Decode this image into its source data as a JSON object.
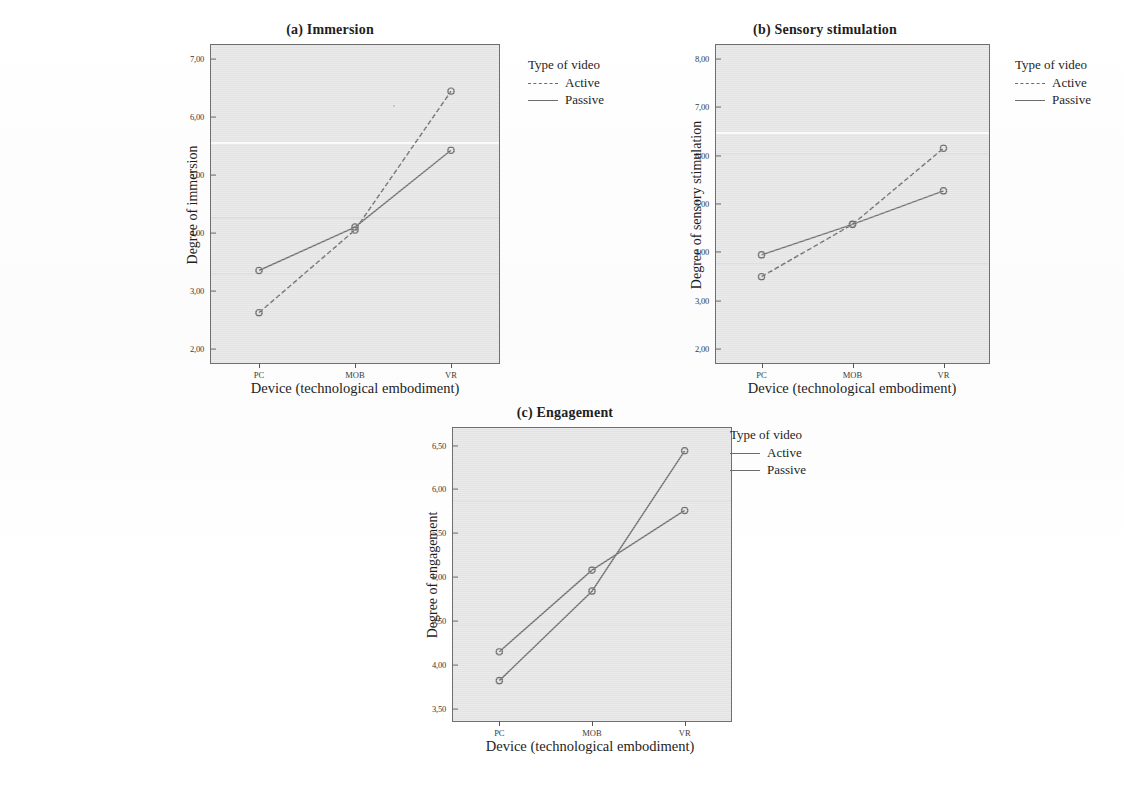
{
  "figure": {
    "panels": [
      "a",
      "b",
      "c"
    ],
    "shared_xlabel": "Device (technological embodiment)",
    "shared_legend_title": "Type of video",
    "series_names": [
      "Active",
      "Passive"
    ],
    "categories": [
      "PC",
      "MOB",
      "VR"
    ]
  },
  "panel_a": {
    "title": "(a) Immersion",
    "ylabel": "Degree of immersion",
    "xlabel": "Device (technological embodiment)",
    "yticks": [
      "7,00",
      "6,00",
      "5,00",
      "4,00",
      "3,00",
      "2,00"
    ],
    "xticks": [
      "PC",
      "MOB",
      "VR"
    ],
    "legend_title": "Type of video",
    "legend": [
      "Active",
      "Passive"
    ]
  },
  "panel_b": {
    "title": "(b) Sensory stimulation",
    "ylabel": "Degree of sensory stimulation",
    "xlabel": "Device (technological embodiment)",
    "yticks": [
      "8,00",
      "7,00",
      "6,00",
      "5,00",
      "4,00",
      "3,00",
      "2,00"
    ],
    "xticks": [
      "PC",
      "MOB",
      "VR"
    ],
    "legend_title": "Type of video",
    "legend": [
      "Active",
      "Passive"
    ]
  },
  "panel_c": {
    "title": "(c) Engagement",
    "ylabel": "Degree of engagement",
    "xlabel": "Device (technological embodiment)",
    "yticks": [
      "6,50",
      "6,00",
      "5,50",
      "5,00",
      "4,50",
      "4,00",
      "3,50"
    ],
    "xticks": [
      "PC",
      "MOB",
      "VR"
    ],
    "legend_title": "Type of video",
    "legend": [
      "Active",
      "Passive"
    ]
  },
  "chart_data": [
    {
      "id": "panel_a",
      "type": "line",
      "title": "(a) Immersion",
      "xlabel": "Device (technological embodiment)",
      "ylabel": "Degree of immersion",
      "categories": [
        "PC",
        "MOB",
        "VR"
      ],
      "ylim": [
        1.75,
        7.25
      ],
      "yticks": [
        2.0,
        3.0,
        4.0,
        5.0,
        6.0,
        7.0
      ],
      "ytick_labels": [
        "2,00",
        "3,00",
        "4,00",
        "5,00",
        "6,00",
        "7,00"
      ],
      "grid": false,
      "legend_title": "Type of video",
      "legend_position": "right",
      "series": [
        {
          "name": "Active",
          "style": "dashed",
          "color": "#707070",
          "values": [
            2.62,
            4.05,
            6.45
          ]
        },
        {
          "name": "Passive",
          "style": "solid",
          "color": "#707070",
          "values": [
            3.35,
            4.1,
            5.43
          ]
        }
      ]
    },
    {
      "id": "panel_b",
      "type": "line",
      "title": "(b) Sensory stimulation",
      "xlabel": "Device (technological embodiment)",
      "ylabel": "Degree of sensory stimulation",
      "categories": [
        "PC",
        "MOB",
        "VR"
      ],
      "ylim": [
        1.72,
        8.28
      ],
      "yticks": [
        2.0,
        3.0,
        4.0,
        5.0,
        6.0,
        7.0,
        8.0
      ],
      "ytick_labels": [
        "2,00",
        "3,00",
        "4,00",
        "5,00",
        "6,00",
        "7,00",
        "8,00"
      ],
      "grid": false,
      "legend_title": "Type of video",
      "legend_position": "right",
      "series": [
        {
          "name": "Active",
          "style": "dashed",
          "color": "#707070",
          "values": [
            3.5,
            4.58,
            6.15
          ]
        },
        {
          "name": "Passive",
          "style": "solid",
          "color": "#707070",
          "values": [
            3.95,
            4.58,
            5.27
          ]
        }
      ]
    },
    {
      "id": "panel_c",
      "type": "line",
      "title": "(c) Engagement",
      "xlabel": "Device (technological embodiment)",
      "ylabel": "Degree of engagement",
      "categories": [
        "PC",
        "MOB",
        "VR"
      ],
      "ylim": [
        3.36,
        6.7
      ],
      "yticks": [
        3.5,
        4.0,
        4.5,
        5.0,
        5.5,
        6.0,
        6.5
      ],
      "ytick_labels": [
        "3,50",
        "4,00",
        "4,50",
        "5,00",
        "5,50",
        "6,00",
        "6,50"
      ],
      "grid": false,
      "legend_title": "Type of video",
      "legend_position": "right",
      "series": [
        {
          "name": "Active",
          "style": "solid",
          "color": "#707070",
          "values": [
            3.82,
            4.84,
            6.44
          ]
        },
        {
          "name": "Passive",
          "style": "solid",
          "color": "#707070",
          "values": [
            4.15,
            5.08,
            5.76
          ]
        }
      ]
    }
  ]
}
